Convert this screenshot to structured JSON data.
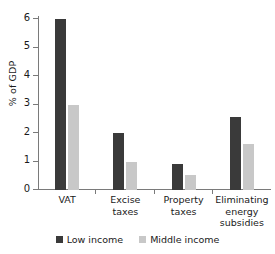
{
  "chart_data": {
    "type": "bar",
    "title": "",
    "subtitle": "",
    "xlabel": "",
    "ylabel": "% of GDP",
    "ylim": [
      0,
      6
    ],
    "yticks": [
      0,
      1,
      2,
      3,
      4,
      5,
      6
    ],
    "ytick_labels": [
      "0",
      "1",
      "2",
      "3",
      "4",
      "5",
      "6"
    ],
    "grid": false,
    "legend_position": "bottom",
    "categories": [
      "VAT",
      "Excise taxes",
      "Property taxes",
      "Eliminating energy subsidies"
    ],
    "series": [
      {
        "name": "Low income",
        "color": "#3a3a3a",
        "values": [
          6.0,
          2.0,
          0.93,
          2.55
        ]
      },
      {
        "name": "Middle income",
        "color": "#c8c8c8",
        "values": [
          3.0,
          1.0,
          0.52,
          1.63
        ]
      }
    ]
  },
  "colors": {
    "low_income": "#3a3a3a",
    "middle_income": "#c8c8c8",
    "axis": "#7a7a7a",
    "text": "#1a1a1a",
    "background": "#ffffff"
  }
}
